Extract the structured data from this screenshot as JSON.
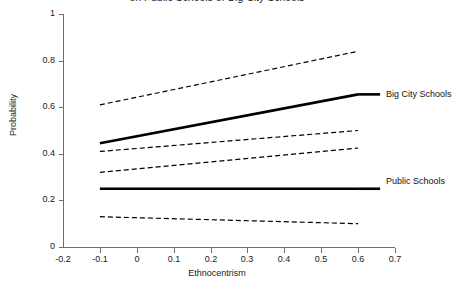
{
  "chart_data": {
    "type": "line",
    "title": "on Public Schools or Big City Schools",
    "title_line1": "",
    "title_line2": "on Public Schools or Big City Schools",
    "xlabel": "Ethnocentrism",
    "ylabel": "Probability",
    "xlim": [
      -0.2,
      0.7
    ],
    "ylim": [
      0,
      1
    ],
    "xticks": [
      -0.2,
      -0.1,
      0,
      0.1,
      0.2,
      0.3,
      0.4,
      0.5,
      0.6,
      0.7
    ],
    "xticklabels": [
      "-0.2",
      "-0.1",
      "0",
      "0.1",
      "0.2",
      "0.3",
      "0.4",
      "0.5",
      "0.6",
      "0.7"
    ],
    "yticks": [
      0,
      0.2,
      0.4,
      0.6,
      0.8,
      1
    ],
    "yticklabels": [
      "0",
      "0.2",
      "0.4",
      "0.6",
      "0.8",
      "1"
    ],
    "grid": false,
    "legend_position": "inline-right-annotations",
    "x": [
      -0.1,
      0.6
    ],
    "series": [
      {
        "name": "Big City Schools upper CI",
        "style": "dashed",
        "width": 1.2,
        "color": "#000000",
        "values": [
          0.61,
          0.84
        ]
      },
      {
        "name": "Big City Schools",
        "style": "solid",
        "width": 2.6,
        "color": "#000000",
        "values": [
          0.445,
          0.655
        ]
      },
      {
        "name": "Big City Schools lower CI",
        "style": "dashed",
        "width": 1.2,
        "color": "#000000",
        "values": [
          0.41,
          0.5
        ]
      },
      {
        "name": "Public Schools upper CI",
        "style": "dashed",
        "width": 1.2,
        "color": "#000000",
        "values": [
          0.32,
          0.425
        ]
      },
      {
        "name": "Public Schools",
        "style": "solid",
        "width": 2.6,
        "color": "#000000",
        "values": [
          0.25,
          0.25
        ]
      },
      {
        "name": "Public Schools lower CI",
        "style": "dashed",
        "width": 1.2,
        "color": "#000000",
        "values": [
          0.13,
          0.1
        ]
      }
    ],
    "annotations": [
      {
        "text": "Big City Schools",
        "x": 0.62,
        "y": 0.655
      },
      {
        "text": "Public Schools",
        "x": 0.62,
        "y": 0.25
      }
    ]
  },
  "axis": {
    "color": "#6f6f6f",
    "text_color": "#1a1a1a"
  },
  "labels": {
    "big_city": "Big City Schools",
    "public": "Public Schools"
  }
}
